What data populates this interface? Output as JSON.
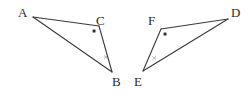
{
  "figure": {
    "background_color": "#ffffff",
    "stroke_color": "#3a3a3a",
    "label_color": "#2b2b2b",
    "stroke_width": 1.1,
    "width": 250,
    "height": 96
  },
  "triangles": [
    {
      "name": "triangle-acb",
      "vertices": [
        {
          "label": "A",
          "x": 33,
          "y": 17,
          "label_x": 18,
          "label_y": 6
        },
        {
          "label": "C",
          "x": 99,
          "y": 26,
          "label_x": 96,
          "label_y": 14
        },
        {
          "label": "B",
          "x": 112,
          "y": 72,
          "label_x": 112,
          "label_y": 75
        }
      ],
      "right_angle_marker": {
        "name": "right-angle-dot-c",
        "x": 94,
        "y": 31,
        "size": 3
      },
      "tick_marker": {
        "name": "tick-mark-cb",
        "x": 106,
        "y": 57,
        "size": 3
      }
    },
    {
      "name": "triangle-fde",
      "vertices": [
        {
          "label": "F",
          "x": 161,
          "y": 29,
          "label_x": 148,
          "label_y": 14
        },
        {
          "label": "D",
          "x": 228,
          "y": 19,
          "label_x": 231,
          "label_y": 6
        },
        {
          "label": "E",
          "x": 143,
          "y": 71,
          "label_x": 134,
          "label_y": 75
        }
      ],
      "right_angle_marker": {
        "name": "right-angle-dot-f",
        "x": 165,
        "y": 34,
        "size": 3
      },
      "tick_marker": {
        "name": "tick-mark-ef",
        "x": 154,
        "y": 58,
        "size": 3
      }
    }
  ],
  "labels": {
    "a": "A",
    "b": "B",
    "c": "C",
    "d": "D",
    "e": "E",
    "f": "F"
  }
}
